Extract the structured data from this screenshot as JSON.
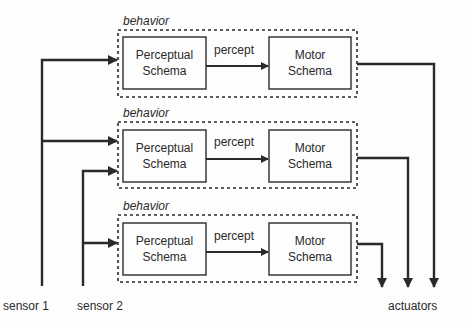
{
  "diagram": {
    "behaviors": [
      {
        "label": "behavior",
        "perceptual": {
          "line1": "Perceptual",
          "line2": "Schema"
        },
        "edge": "percept",
        "motor": {
          "line1": "Motor",
          "line2": "Schema"
        }
      },
      {
        "label": "behavior",
        "perceptual": {
          "line1": "Perceptual",
          "line2": "Schema"
        },
        "edge": "percept",
        "motor": {
          "line1": "Motor",
          "line2": "Schema"
        }
      },
      {
        "label": "behavior",
        "perceptual": {
          "line1": "Perceptual",
          "line2": "Schema"
        },
        "edge": "percept",
        "motor": {
          "line1": "Motor",
          "line2": "Schema"
        }
      }
    ],
    "inputs": [
      "sensor 1",
      "sensor 2"
    ],
    "output": "actuators",
    "colors": {
      "line": "#2a2a2a",
      "background": "#fdfdfd"
    }
  }
}
